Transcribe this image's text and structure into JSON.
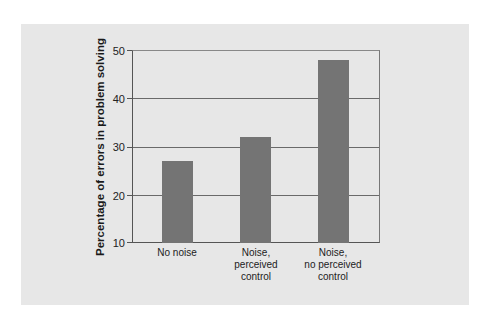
{
  "chart_data": {
    "type": "bar",
    "title": "",
    "xlabel": "",
    "ylabel": "Percentage of errors in problem solving",
    "categories": [
      "No noise",
      "Noise,\nperceived\ncontrol",
      "Noise,\nno perceived\ncontrol"
    ],
    "values": [
      27,
      32,
      48
    ],
    "ylim": [
      10,
      50
    ],
    "yticks": [
      10,
      20,
      30,
      40,
      50
    ],
    "grid": true,
    "legend": null,
    "bar_color": "#747474",
    "panel_color": "#e7e7e7"
  },
  "labels": {
    "ylabel": "Percentage of errors in problem solving",
    "yticks": [
      "50",
      "40",
      "30",
      "20",
      "10"
    ],
    "categories": [
      "No noise",
      "Noise,\nperceived\ncontrol",
      "Noise,\nno perceived\ncontrol"
    ]
  }
}
